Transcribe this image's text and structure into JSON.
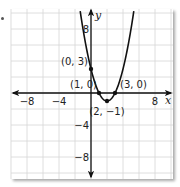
{
  "chart_data": {
    "type": "line",
    "title": "",
    "function": "y = (x - 1)(x - 3) = x^2 - 4x + 3",
    "xlabel": "x",
    "ylabel": "y",
    "xlim": [
      -10,
      10
    ],
    "ylim": [
      -10.5,
      10
    ],
    "grid": true,
    "grid_step": 2,
    "x_ticks": [
      {
        "value": -8,
        "label": "−8"
      },
      {
        "value": -4,
        "label": "−4"
      },
      {
        "value": 8,
        "label": "8"
      }
    ],
    "y_ticks": [
      {
        "value": 8,
        "label": "8"
      },
      {
        "value": -4,
        "label": "−4"
      },
      {
        "value": -8,
        "label": "−8"
      }
    ],
    "points": [
      {
        "x": 0,
        "y": 3,
        "label": "(0, 3)"
      },
      {
        "x": 1,
        "y": 0,
        "label": "(1, 0)"
      },
      {
        "x": 3,
        "y": 0,
        "label": "(3, 0)"
      },
      {
        "x": 2,
        "y": -1,
        "label": "(2, −1)"
      }
    ],
    "series": [
      {
        "name": "parabola",
        "a": 1,
        "b": -4,
        "c": 3,
        "x_range": [
          -1.35,
          5.35
        ]
      }
    ]
  }
}
